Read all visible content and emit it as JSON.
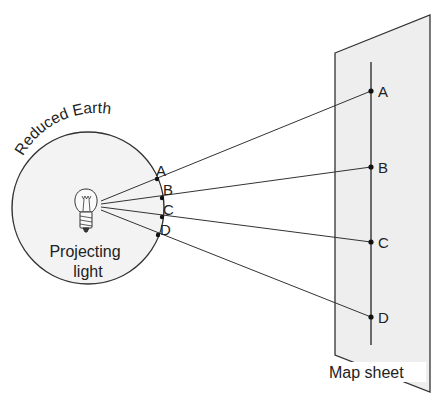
{
  "figure": {
    "type": "diagram",
    "sphere": {
      "label": "Reduced Earth",
      "light_label_line1": "Projecting",
      "light_label_line2": "light",
      "center": [
        88,
        208
      ],
      "radius": 76,
      "fill": "#f3f3f3"
    },
    "sphere_points": [
      {
        "id": "A",
        "label": "A",
        "x": 157,
        "y": 179
      },
      {
        "id": "B",
        "label": "B",
        "x": 162,
        "y": 198
      },
      {
        "id": "C",
        "label": "C",
        "x": 162,
        "y": 217
      },
      {
        "id": "D",
        "label": "D",
        "x": 158,
        "y": 235
      }
    ],
    "map_points": [
      {
        "id": "A",
        "label": "A",
        "x": 371,
        "y": 91
      },
      {
        "id": "B",
        "label": "B",
        "x": 371,
        "y": 167
      },
      {
        "id": "C",
        "label": "C",
        "x": 371,
        "y": 242
      },
      {
        "id": "D",
        "label": "D",
        "x": 371,
        "y": 317
      }
    ],
    "map_sheet": {
      "label": "Map sheet",
      "fill": "#eeeeee"
    }
  }
}
